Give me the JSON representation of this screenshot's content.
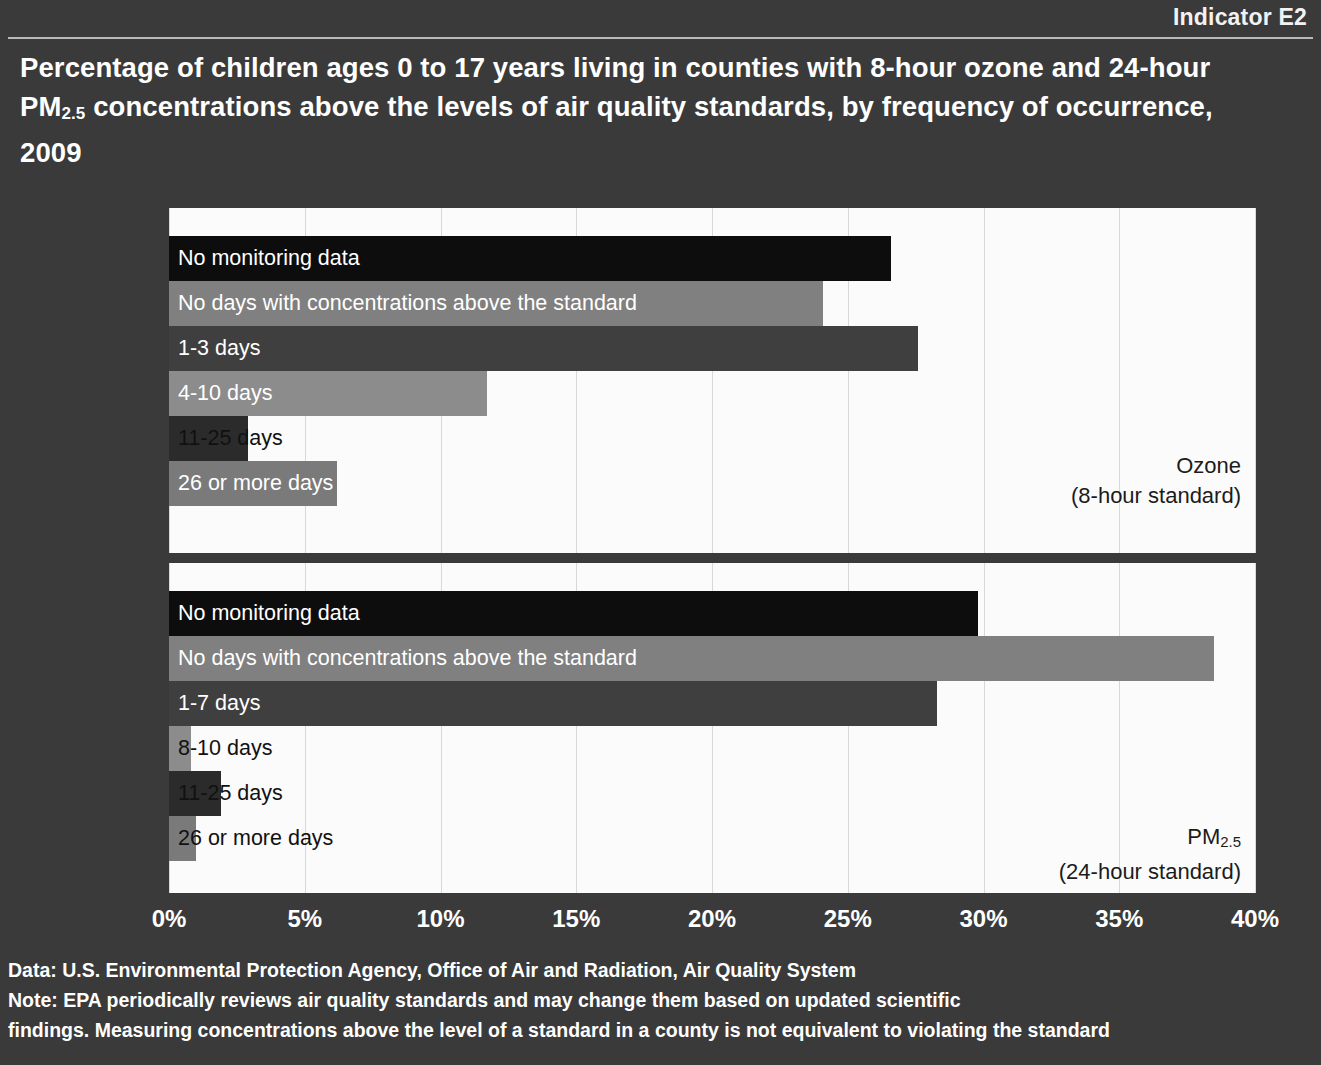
{
  "header": {
    "indicator": "Indicator E2",
    "title_line1": "Percentage of children ages 0 to 17 years living in counties with 8-hour ozone",
    "title_line2_a": "and 24-hour PM",
    "title_line2_sub": "2.5",
    "title_line2_b": " concentrations above the levels of air quality standards, by",
    "title_line3": "frequency of occurrence, 2009"
  },
  "chart_data": {
    "type": "bar",
    "title": "Percentage of children ages 0 to 17 years living in counties with 8-hour ozone and 24-hour PM2.5 concentrations above the levels of air quality standards, by frequency of occurrence, 2009",
    "orientation": "horizontal",
    "xlabel": "",
    "ylabel": "",
    "xlim": [
      0,
      40
    ],
    "xticks": [
      "0%",
      "5%",
      "10%",
      "15%",
      "20%",
      "25%",
      "30%",
      "35%",
      "40%"
    ],
    "xtick_values": [
      0,
      5,
      10,
      15,
      20,
      25,
      30,
      35,
      40
    ],
    "grid": true,
    "legend": "none",
    "panels": [
      {
        "name": "ozone",
        "caption_line1": "Ozone",
        "caption_line2": "(8-hour standard)",
        "categories": [
          "No monitoring data",
          "No days with concentrations above the standard",
          "1-3 days",
          "4-10 days",
          "11-25 days",
          "26 or more days"
        ],
        "values": [
          26.6,
          24.1,
          27.6,
          11.7,
          2.9,
          6.2
        ],
        "bar_colors": [
          "#0d0d0d",
          "#808080",
          "#3f3f3f",
          "#8c8c8c",
          "#2b2b2b",
          "#7a7a7a"
        ],
        "label_colors": [
          "#ffffff",
          "#ffffff",
          "#ffffff",
          "#ffffff",
          "#111111",
          "#ffffff"
        ]
      },
      {
        "name": "pm25",
        "caption_line1_a": "PM",
        "caption_line1_sub": "2.5",
        "caption_line2": "(24-hour standard)",
        "categories": [
          "No monitoring data",
          "No days with concentrations above the standard",
          "1-7 days",
          "8-10 days",
          "11-25 days",
          "26 or more days"
        ],
        "values": [
          29.8,
          38.5,
          28.3,
          0.8,
          1.9,
          1.0
        ],
        "bar_colors": [
          "#0d0d0d",
          "#808080",
          "#3f3f3f",
          "#8c8c8c",
          "#2b2b2b",
          "#7a7a7a"
        ],
        "label_colors": [
          "#ffffff",
          "#ffffff",
          "#ffffff",
          "#111111",
          "#111111",
          "#111111"
        ]
      }
    ]
  },
  "footer": {
    "line1": "Data: U.S. Environmental Protection Agency, Office of Air and Radiation, Air Quality System",
    "line2": "Note: EPA  periodically reviews air quality standards and may change them based on updated scientific",
    "line3": "findings. Measuring concentrations above the level of a standard in a county is not equivalent to violating the standard"
  },
  "colors": {
    "background": "#3a3a3a",
    "plot_background": "#fbfbfb",
    "text": "#ffffff",
    "gridline": "#d8d8d8"
  }
}
